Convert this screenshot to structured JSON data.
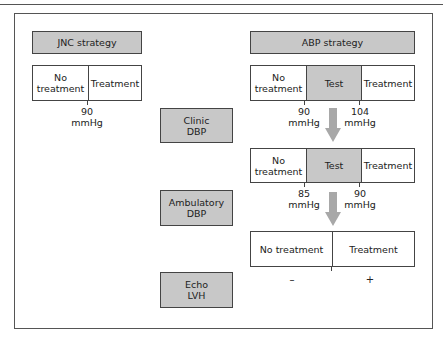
{
  "jnc": {
    "title": "JNC strategy",
    "segments": [
      "No treatment",
      "Treatment"
    ],
    "threshold": {
      "value": "90",
      "unit": "mmHg"
    }
  },
  "abp": {
    "title": "ABP strategy",
    "row1": {
      "segments": [
        "No treatment",
        "Test",
        "Treatment"
      ],
      "thresholds": [
        {
          "value": "90",
          "unit": "mmHg"
        },
        {
          "value": "104",
          "unit": "mmHg"
        }
      ]
    },
    "row2": {
      "segments": [
        "No treatment",
        "Test",
        "Treatment"
      ],
      "thresholds": [
        {
          "value": "85",
          "unit": "mmHg"
        },
        {
          "value": "90",
          "unit": "mmHg"
        }
      ]
    },
    "row3": {
      "segments": [
        "No treatment",
        "Treatment"
      ],
      "signs": [
        "–",
        "+"
      ]
    }
  },
  "tests": [
    {
      "line1": "Clinic",
      "line2": "DBP"
    },
    {
      "line1": "Ambulatory",
      "line2": "DBP"
    },
    {
      "line1": "Echo",
      "line2": "LVH"
    }
  ],
  "colors": {
    "box_fill": "#c8c8c8",
    "arrow": "#a8a8a8",
    "border": "#444444"
  }
}
